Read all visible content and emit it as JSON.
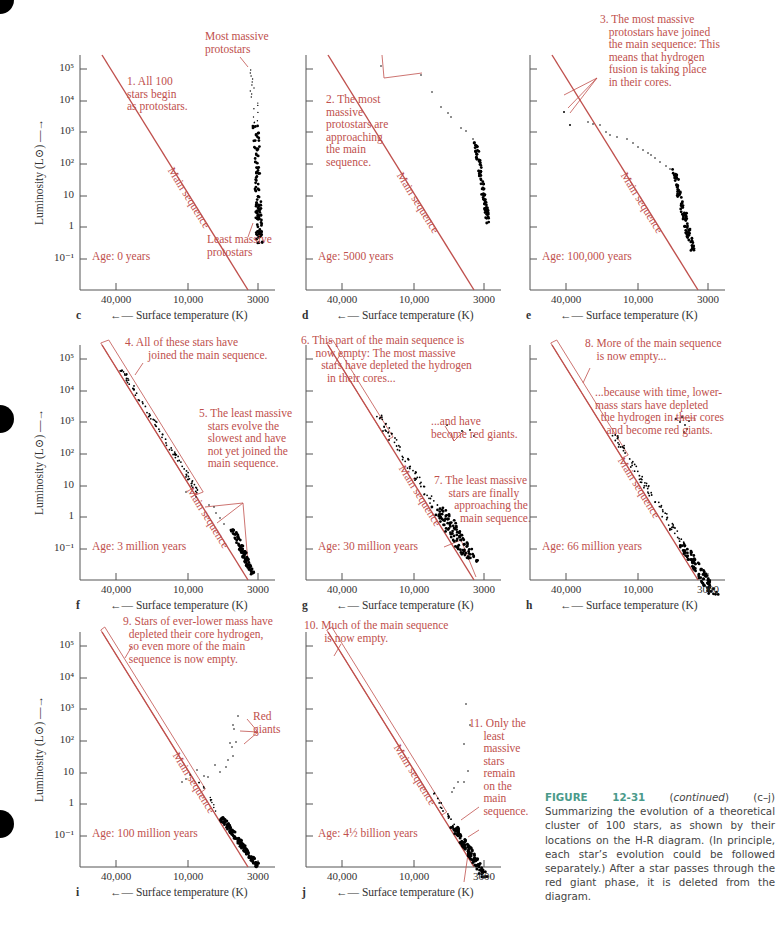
{
  "figure": {
    "number_label": "FIGURE 12-31",
    "continued": "continued",
    "caption_rest": " (c–j) Summarizing the evolution of a theoretical cluster of 100 stars, as shown by their locations on the H-R diagram. (In principle, each star’s evolution could be followed separately.) After a star passes through the red giant phase, it is deleted from the diagram.",
    "caption_prefix_paren_open": " (",
    "caption_prefix_paren_close": ")"
  },
  "axes": {
    "ylabel": "Luminosity (L⊙) —→",
    "xlabel": "←— Surface temperature (K)",
    "y_ticks": [
      "10⁵",
      "10⁴",
      "10³",
      "10²",
      "10",
      "1",
      "10⁻¹"
    ],
    "x_ticks": [
      "40,000",
      "10,000",
      "3000"
    ],
    "main_sequence_label": "Main sequence"
  },
  "colors": {
    "annotation": "#c0504d",
    "main_sequence": "#c0504d",
    "stars": "#000000",
    "axis": "#555555",
    "caption_figure": "#4a9a8a"
  },
  "panels": [
    {
      "letter": "c",
      "age": "Age: 0 years",
      "annotations": [
        "Most massive\nprotostars",
        "1. All 100\nstars begin\nas protostars.",
        "Least massive\nprotostars"
      ]
    },
    {
      "letter": "d",
      "age": "Age: 5000 years",
      "annotations": [
        "2. The most\nmassive\nprotostars are\napproaching\nthe main\nsequence."
      ]
    },
    {
      "letter": "e",
      "age": "Age: 100,000 years",
      "annotations": [
        "3. The most massive\n   protostars have joined\n   the main sequence: This\n   means that hydrogen\n   fusion is taking place\n   in their cores."
      ]
    },
    {
      "letter": "f",
      "age": "Age: 3 million years",
      "annotations": [
        "4. All of these stars have\n        joined the main sequence.",
        "5. The least massive\n   stars evolve the\n   slowest and have\n   not yet joined the\n   main sequence."
      ]
    },
    {
      "letter": "g",
      "age": "Age: 30 million years",
      "annotations": [
        "6. This part of the main sequence is\n     now empty: The most massive\n       stars have depleted the hydrogen\n         in their cores...",
        "...and have\nbecome red giants.",
        "7. The least massive\n     stars are finally\n       approaching the\n         main sequence."
      ]
    },
    {
      "letter": "h",
      "age": "Age: 66 million years",
      "annotations": [
        "8. More of the main sequence\n    is now empty...",
        "...because with time, lower-\nmass stars have depleted\n  the hydrogen in their cores\n    and become red giants."
      ]
    },
    {
      "letter": "i",
      "age": "Age: 100 million years",
      "annotations": [
        "9. Stars of ever-lower mass have\n  depleted their core hydrogen,\n  so even more of the main\n  sequence is now empty.",
        "Red\ngiants"
      ]
    },
    {
      "letter": "j",
      "age": "Age: 4½  billion years",
      "annotations": [
        "10. Much of the main sequence\n       is now empty.",
        "11. Only the\n     least\n     massive\n     stars\n     remain\n     on the\n     main\n     sequence."
      ]
    }
  ],
  "chart_data": [
    {
      "type": "scatter",
      "panel": "c",
      "title": "Age: 0 years",
      "xlabel": "Surface temperature (K)",
      "ylabel": "Luminosity (L⊙)",
      "x_ticks": [
        40000,
        10000,
        3000
      ],
      "y_ticks": [
        100000,
        10000,
        1000,
        100,
        10,
        1,
        0.1
      ],
      "x_reversed": true,
      "y_scale": "log",
      "series": [
        {
          "name": "protostars",
          "description": "vertical column of 100 protostars near T≈2800-3200 K, L from ~1e5 down to ~50",
          "approx_range": {
            "T": [
              2800,
              3200
            ],
            "L": [
              50,
              100000
            ]
          }
        }
      ]
    },
    {
      "type": "scatter",
      "panel": "d",
      "title": "Age: 5000 years",
      "x_reversed": true,
      "y_scale": "log",
      "series": [
        {
          "name": "protostars",
          "description": "most massive protostars moving left toward main sequence; others clustered near 3000 K",
          "approx_range": {
            "T": [
              2900,
              15000
            ],
            "L": [
              50,
              100000
            ]
          }
        }
      ]
    },
    {
      "type": "scatter",
      "panel": "e",
      "title": "Age: 100,000 years",
      "x_reversed": true,
      "y_scale": "log",
      "series": [
        {
          "name": "stars",
          "description": "most massive on main sequence at L~1e4-1e3; trail of stars to low-mass clump at ~3500 K, L 10-100",
          "approx_range": {
            "T": [
              3200,
              25000
            ],
            "L": [
              7,
              20000
            ]
          }
        }
      ]
    },
    {
      "type": "scatter",
      "panel": "f",
      "title": "Age: 3 million years",
      "x_reversed": true,
      "y_scale": "log",
      "series": [
        {
          "name": "stars",
          "description": "massive stars along main sequence from 1e5 to ~30; low-mass stars off-MS at T~3000-4000 K, L 0.3-20",
          "approx_range": {
            "T": [
              3000,
              40000
            ],
            "L": [
              0.3,
              100000
            ]
          }
        }
      ]
    },
    {
      "type": "scatter",
      "panel": "g",
      "title": "Age: 30 million years",
      "x_reversed": true,
      "y_scale": "log",
      "series": [
        {
          "name": "main sequence",
          "approx_range": {
            "T": [
              3000,
              20000
            ],
            "L": [
              0.2,
              5000
            ]
          }
        },
        {
          "name": "red giants",
          "approx_range": {
            "T": [
              4000,
              5000
            ],
            "L": [
              1000,
              5000
            ]
          }
        }
      ]
    },
    {
      "type": "scatter",
      "panel": "h",
      "title": "Age: 66 million years",
      "x_reversed": true,
      "y_scale": "log",
      "series": [
        {
          "name": "main sequence",
          "approx_range": {
            "T": [
              3000,
              12000
            ],
            "L": [
              0.05,
              300
            ]
          }
        },
        {
          "name": "red giants",
          "approx_range": {
            "T": [
              4000,
              5000
            ],
            "L": [
              30,
              150
            ]
          }
        }
      ]
    },
    {
      "type": "scatter",
      "panel": "i",
      "title": "Age: 100 million years",
      "x_reversed": true,
      "y_scale": "log",
      "series": [
        {
          "name": "main sequence",
          "approx_range": {
            "T": [
              3000,
              10000
            ],
            "L": [
              0.02,
              20
            ]
          }
        },
        {
          "name": "red giants",
          "approx_range": {
            "T": [
              4000,
              6000
            ],
            "L": [
              10,
              2500
            ]
          }
        }
      ]
    },
    {
      "type": "scatter",
      "panel": "j",
      "title": "Age: 4½ billion years",
      "x_reversed": true,
      "y_scale": "log",
      "series": [
        {
          "name": "main sequence",
          "approx_range": {
            "T": [
              3000,
              7000
            ],
            "L": [
              0.02,
              2
            ]
          }
        },
        {
          "name": "red giants",
          "approx_range": {
            "T": [
              4000,
              6000
            ],
            "L": [
              2,
              3000
            ]
          }
        }
      ]
    }
  ]
}
